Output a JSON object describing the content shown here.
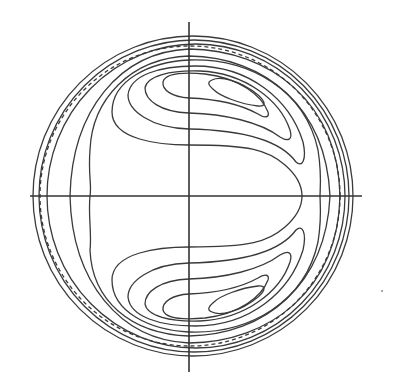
{
  "figure": {
    "type": "contour-diagram",
    "line_color": "#3a3a3a",
    "background": "#ffffff",
    "center": [
      189,
      196
    ],
    "outer_radius": 160,
    "axes": {
      "vertical": {
        "x": 189,
        "y1": 22,
        "y2": 372
      },
      "horizontal": {
        "y": 196,
        "x1": 30,
        "x2": 362
      }
    },
    "boundary_circles": {
      "solid_count": 3,
      "dashed_count": 1
    },
    "lobes": [
      {
        "name": "upper-vortex",
        "nested_contours": 5,
        "core_center": [
          265,
          82
        ]
      },
      {
        "name": "lower-vortex",
        "nested_contours": 5,
        "core_center": [
          265,
          310
        ]
      }
    ],
    "open_contours": 3
  }
}
